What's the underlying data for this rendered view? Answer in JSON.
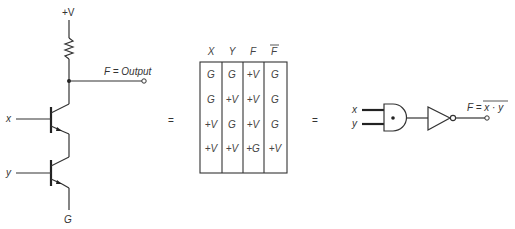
{
  "circuit": {
    "supply_label": "+V",
    "output_label": "F = Output",
    "input_x_label": "x",
    "input_y_label": "y",
    "ground_label": "G"
  },
  "equals_1": "=",
  "equals_2": "=",
  "truth_table": {
    "headers": [
      "X",
      "Y",
      "F",
      "F"
    ],
    "header_overline": [
      false,
      false,
      false,
      true
    ],
    "rows": [
      [
        "G",
        "G",
        "+V",
        "G"
      ],
      [
        "G",
        "+V",
        "+V",
        "G"
      ],
      [
        "+V",
        "G",
        "+V",
        "G"
      ],
      [
        "+V",
        "+V",
        "+G",
        "+V"
      ]
    ]
  },
  "gate_diagram": {
    "input_x_label": "x",
    "input_y_label": "y",
    "output_label_prefix": "F = ",
    "output_expression": "x · y",
    "output_overline": true,
    "gates": [
      "and-gate",
      "not-gate"
    ]
  }
}
